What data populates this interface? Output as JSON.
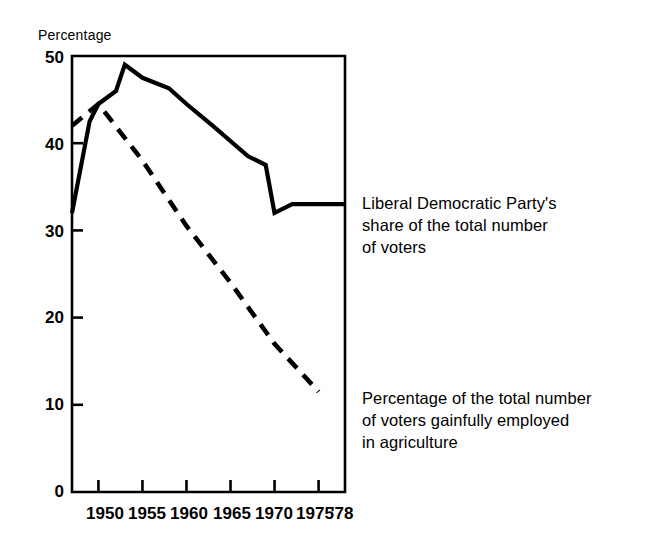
{
  "chart_data": {
    "type": "line",
    "title": "",
    "subtitle": "",
    "ylabel": "Percentage",
    "xlabel": "",
    "ylim": [
      0,
      50
    ],
    "xlim": [
      1947,
      1978
    ],
    "yticks": [
      "0",
      "10",
      "20",
      "30",
      "40",
      "50"
    ],
    "ytick_values": [
      0,
      10,
      20,
      30,
      40,
      50
    ],
    "xticks": [
      "1950",
      "1955",
      "1960",
      "1965",
      "1970",
      "1975",
      "'78"
    ],
    "xtick_values": [
      1950,
      1955,
      1960,
      1965,
      1970,
      1975,
      1978
    ],
    "grid": false,
    "legend_position": "right-inline-annotations",
    "series": [
      {
        "name": "Liberal Democratic Party's share of the total number of voters",
        "style": "solid",
        "color": "#000000",
        "x": [
          1947,
          1949,
          1950,
          1952,
          1953,
          1955,
          1958,
          1960,
          1963,
          1967,
          1969,
          1970,
          1972,
          1976,
          1978
        ],
        "values": [
          32.0,
          42.5,
          44.5,
          46.0,
          49.0,
          47.5,
          46.3,
          44.5,
          42.0,
          38.5,
          37.5,
          32.0,
          33.0,
          33.0,
          33.0
        ]
      },
      {
        "name": "Percentage of the total number of voters gainfully employed in agriculture",
        "style": "dashed",
        "color": "#000000",
        "x": [
          1947,
          1950,
          1955,
          1960,
          1965,
          1970,
          1975
        ],
        "values": [
          42.0,
          44.5,
          38.0,
          30.5,
          24.0,
          17.0,
          11.5
        ]
      }
    ],
    "annotations": [
      {
        "name": "ldp-share-annotation",
        "text": "Liberal Democratic Party's\nshare of the total number\nof voters"
      },
      {
        "name": "agriculture-annotation",
        "text": "Percentage of the total number\nof voters gainfully employed\nin agriculture"
      }
    ]
  }
}
